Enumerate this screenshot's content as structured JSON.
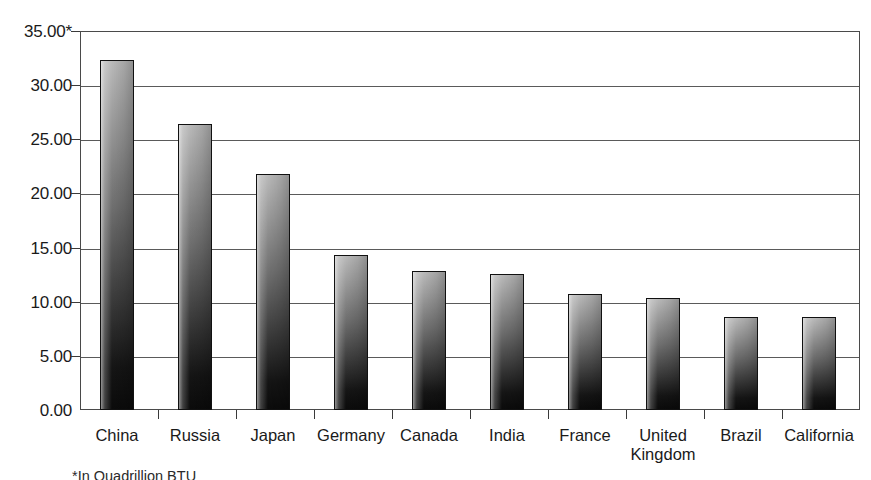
{
  "chart_data": {
    "type": "bar",
    "title": "",
    "subtitle": "",
    "xlabel": "",
    "ylabel": "",
    "categories": [
      "China",
      "Russia",
      "Japan",
      "Germany",
      "Canada",
      "India",
      "France",
      "United\nKingdom",
      "Brazil",
      "California"
    ],
    "values": [
      32.3,
      26.4,
      21.8,
      14.3,
      12.8,
      12.6,
      10.7,
      10.3,
      8.6,
      8.6
    ],
    "ylim": [
      0,
      35
    ],
    "ytick_values": [
      0,
      5,
      10,
      15,
      20,
      25,
      30,
      35
    ],
    "ytick_labels": [
      "0.00",
      "5.00",
      "10.00",
      "15.00",
      "20.00",
      "25.00",
      "30.00",
      "35.00*"
    ],
    "grid": true,
    "legend": false,
    "legend_position": "none",
    "annotations": [
      "*In Quadrillion BTU"
    ],
    "bar_color_top": "#b9b9b9",
    "bar_color_bottom": "#0b0b0b",
    "axis_color": "#4a4a4a",
    "grid_color": "#5a5a5a",
    "background_color": "#ffffff"
  },
  "footnote": {
    "text": "*In Quadrillion BTU"
  }
}
